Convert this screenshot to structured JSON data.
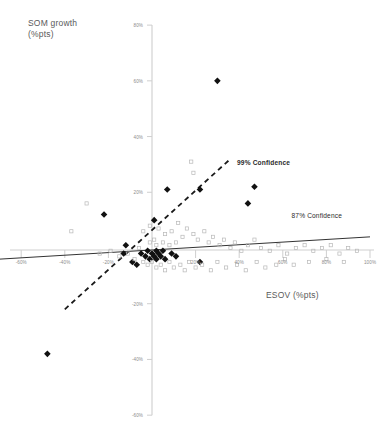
{
  "chart_data": {
    "type": "scatter",
    "title": "",
    "xlabel": "ESOV (%pts)",
    "ylabel": "SOM growth\n(%pts)",
    "xlim": [
      -70,
      100
    ],
    "ylim": [
      -60,
      80
    ],
    "xticks": [
      -60,
      -40,
      -20,
      20,
      40,
      60,
      80,
      100
    ],
    "xtick_labels": [
      "-60%",
      "-40%",
      "-20%",
      "20%",
      "40%",
      "60%",
      "80%",
      "100%"
    ],
    "yticks": [
      80,
      60,
      40,
      20,
      -20,
      -40,
      -60
    ],
    "ytick_labels": [
      "80%",
      "60%",
      "40%",
      "20%",
      "-20%",
      "-40%",
      "-60%"
    ],
    "grid": false,
    "legend_position": "inline-annotations",
    "series": [
      {
        "name": "Highlighted brands",
        "marker": "filled-diamond",
        "color": "#111111",
        "points": [
          [
            30,
            60
          ],
          [
            47,
            22
          ],
          [
            44,
            16
          ],
          [
            22,
            21
          ],
          [
            7,
            21
          ],
          [
            -22,
            12
          ],
          [
            1,
            10
          ],
          [
            -12,
            1
          ],
          [
            -13,
            -2
          ],
          [
            -5,
            -2
          ],
          [
            -3,
            -3
          ],
          [
            -2,
            -1
          ],
          [
            -1,
            -4
          ],
          [
            0,
            -2
          ],
          [
            1,
            -3
          ],
          [
            2,
            -1
          ],
          [
            2,
            -4
          ],
          [
            3,
            -2
          ],
          [
            4,
            -3
          ],
          [
            5,
            -1
          ],
          [
            6,
            -4
          ],
          [
            -7,
            -6
          ],
          [
            -9,
            -5
          ],
          [
            9,
            -2
          ],
          [
            11,
            -3
          ],
          [
            22,
            -5
          ],
          [
            -48,
            -38
          ]
        ]
      },
      {
        "name": "Other brands",
        "marker": "open-square",
        "color": "#b8b8b8",
        "points": [
          [
            18,
            31
          ],
          [
            19,
            27
          ],
          [
            -30,
            16
          ],
          [
            -37,
            6
          ],
          [
            -1,
            8
          ],
          [
            -4,
            6
          ],
          [
            3,
            7
          ],
          [
            6,
            5
          ],
          [
            9,
            6
          ],
          [
            12,
            9
          ],
          [
            14,
            4
          ],
          [
            16,
            7
          ],
          [
            19,
            5
          ],
          [
            21,
            3
          ],
          [
            24,
            6
          ],
          [
            26,
            2
          ],
          [
            28,
            4
          ],
          [
            31,
            1
          ],
          [
            33,
            3
          ],
          [
            36,
            0
          ],
          [
            38,
            2
          ],
          [
            41,
            -1
          ],
          [
            44,
            1
          ],
          [
            47,
            3
          ],
          [
            50,
            0
          ],
          [
            54,
            -1
          ],
          [
            58,
            1
          ],
          [
            62,
            -2
          ],
          [
            66,
            0
          ],
          [
            70,
            1
          ],
          [
            74,
            -1
          ],
          [
            78,
            0
          ],
          [
            82,
            1
          ],
          [
            86,
            -2
          ],
          [
            90,
            0
          ],
          [
            94,
            -1
          ],
          [
            -24,
            -2
          ],
          [
            -19,
            -1
          ],
          [
            -15,
            -3
          ],
          [
            -11,
            -2
          ],
          [
            -8,
            -4
          ],
          [
            -6,
            0
          ],
          [
            -4,
            -5
          ],
          [
            -2,
            -6
          ],
          [
            0,
            -5
          ],
          [
            2,
            -7
          ],
          [
            4,
            -6
          ],
          [
            6,
            -8
          ],
          [
            8,
            -5
          ],
          [
            10,
            -7
          ],
          [
            13,
            -6
          ],
          [
            15,
            -8
          ],
          [
            17,
            -5
          ],
          [
            20,
            -7
          ],
          [
            23,
            -6
          ],
          [
            27,
            -8
          ],
          [
            30,
            -5
          ],
          [
            34,
            -7
          ],
          [
            39,
            -6
          ],
          [
            43,
            -8
          ],
          [
            48,
            -5
          ],
          [
            52,
            -7
          ],
          [
            57,
            -6
          ],
          [
            61,
            -4
          ],
          [
            65,
            -6
          ],
          [
            72,
            -5
          ],
          [
            80,
            -4
          ],
          [
            88,
            -5
          ],
          [
            5,
            2
          ],
          [
            8,
            1
          ],
          [
            11,
            2
          ],
          [
            2,
            1
          ],
          [
            -1,
            2
          ],
          [
            1,
            3
          ]
        ]
      }
    ],
    "trendlines": [
      {
        "name": "99% Confidence",
        "style": "dashed",
        "color": "#1a1a1a",
        "width": 1.8,
        "x0": -40,
        "y0": -22,
        "x1": 36,
        "y1": 32
      },
      {
        "name": "87% Confidence",
        "style": "solid",
        "color": "#333333",
        "width": 1.0,
        "x0": -70,
        "y0": -4,
        "x1": 100,
        "y1": 4
      }
    ],
    "annotations": [
      {
        "text": "99% Confidence",
        "x": 39,
        "y": 30,
        "bold": true
      },
      {
        "text": "87% Confidence",
        "x": 64,
        "y": 11,
        "bold": false
      }
    ]
  }
}
